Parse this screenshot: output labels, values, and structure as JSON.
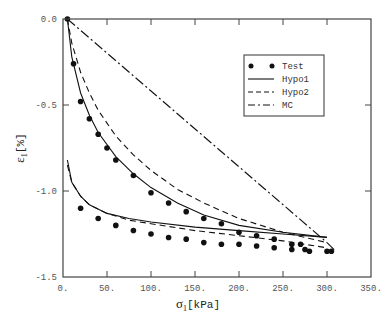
{
  "chart_data": {
    "type": "line",
    "title": "",
    "xlabel": "σ1 [kPa]",
    "ylabel": "ε1 [%]",
    "xlim": [
      0,
      350
    ],
    "ylim": [
      -1.5,
      0.0
    ],
    "x_ticks": [
      0,
      50,
      100,
      150,
      200,
      250,
      300,
      350
    ],
    "x_tick_labels": [
      "0.",
      "50.",
      "100.",
      "150.",
      "200.",
      "250.",
      "300.",
      "350."
    ],
    "y_ticks": [
      0.0,
      -0.5,
      -1.0,
      -1.5
    ],
    "y_tick_labels": [
      "0.0",
      "-0.5",
      "-1.0",
      "-1.5"
    ],
    "grid": false,
    "legend_position": "upper right",
    "series": [
      {
        "name": "Test",
        "style": "markers",
        "loading": {
          "x": [
            5,
            12,
            20,
            30,
            40,
            50,
            60,
            80,
            100,
            120,
            140,
            160,
            180,
            200,
            220,
            240,
            260,
            270,
            275
          ],
          "y": [
            0.0,
            -0.26,
            -0.48,
            -0.58,
            -0.67,
            -0.75,
            -0.82,
            -0.91,
            -1.01,
            -1.07,
            -1.12,
            -1.16,
            -1.19,
            -1.24,
            -1.26,
            -1.28,
            -1.31,
            -1.31,
            -1.34
          ]
        },
        "unloading": {
          "x": [
            20,
            40,
            60,
            80,
            100,
            120,
            140,
            160,
            180,
            200,
            220,
            240,
            260,
            280,
            300,
            305
          ],
          "y": [
            -1.1,
            -1.16,
            -1.2,
            -1.23,
            -1.25,
            -1.27,
            -1.28,
            -1.3,
            -1.31,
            -1.31,
            -1.32,
            -1.33,
            -1.34,
            -1.35,
            -1.35,
            -1.35
          ]
        }
      },
      {
        "name": "Hypo1",
        "style": "solid",
        "loading": {
          "x": [
            5,
            10,
            20,
            30,
            40,
            60,
            80,
            100,
            130,
            160,
            200,
            250,
            300
          ],
          "y": [
            0.0,
            -0.22,
            -0.43,
            -0.56,
            -0.66,
            -0.8,
            -0.9,
            -0.98,
            -1.07,
            -1.14,
            -1.2,
            -1.24,
            -1.27
          ]
        },
        "unloading": {
          "x": [
            5,
            10,
            20,
            30,
            50,
            75,
            100,
            150,
            200,
            250,
            300
          ],
          "y": [
            -0.82,
            -0.95,
            -1.03,
            -1.08,
            -1.13,
            -1.16,
            -1.18,
            -1.21,
            -1.23,
            -1.25,
            -1.27
          ]
        }
      },
      {
        "name": "Hypo2",
        "style": "dashed",
        "loading": {
          "x": [
            5,
            10,
            20,
            30,
            40,
            60,
            80,
            100,
            130,
            160,
            200,
            250,
            300
          ],
          "y": [
            0.0,
            -0.14,
            -0.31,
            -0.43,
            -0.53,
            -0.68,
            -0.79,
            -0.88,
            -0.99,
            -1.07,
            -1.16,
            -1.24,
            -1.3
          ]
        },
        "unloading": {
          "x": [
            5,
            10,
            20,
            30,
            50,
            75,
            100,
            150,
            200,
            250,
            300
          ],
          "y": [
            -0.85,
            -0.95,
            -1.03,
            -1.08,
            -1.13,
            -1.17,
            -1.19,
            -1.23,
            -1.26,
            -1.29,
            -1.33
          ]
        }
      },
      {
        "name": "MC",
        "style": "dash-dot",
        "loading": {
          "x": [
            5,
            300
          ],
          "y": [
            0.0,
            -1.3
          ]
        },
        "unloading": {
          "x": [
            300,
            310
          ],
          "y": [
            -1.3,
            -1.35
          ]
        }
      }
    ]
  },
  "legend": {
    "items": [
      {
        "label": "Test",
        "style": "markers"
      },
      {
        "label": "Hypo1",
        "style": "solid"
      },
      {
        "label": "Hypo2",
        "style": "dashed"
      },
      {
        "label": "MC",
        "style": "dash-dot"
      }
    ]
  },
  "axes": {
    "xlabel_main": "σ",
    "xlabel_sub": "1",
    "xlabel_unit": "[kPa]",
    "ylabel_main": "ε",
    "ylabel_sub": "1",
    "ylabel_unit": "[%]"
  },
  "colors": {
    "line": "#111111",
    "frame": "#444444",
    "tick_text": "#555555"
  }
}
